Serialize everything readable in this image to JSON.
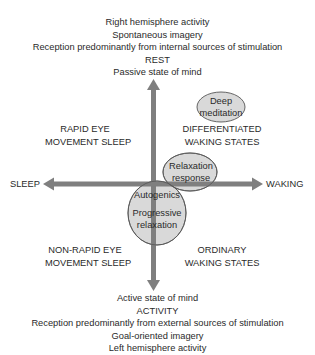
{
  "top_labels": [
    "Right hemisphere activity",
    "Spontaneous imagery",
    "Reception predominantly from internal sources of stimulation",
    "REST",
    "Passive state of mind"
  ],
  "bottom_labels": [
    "Active state of mind",
    "ACTIVITY",
    "Reception predominantly from external sources of stimulation",
    "Goal-oriented imagery",
    "Left hemisphere activity"
  ],
  "axes": {
    "left": "SLEEP",
    "right": "WAKING"
  },
  "quadrants": {
    "top_left": [
      "RAPID EYE",
      "MOVEMENT SLEEP"
    ],
    "top_right": [
      "DIFFERENTIATED",
      "WAKING STATES"
    ],
    "bottom_left": [
      "NON-RAPID EYE",
      "MOVEMENT SLEEP"
    ],
    "bottom_right": [
      "ORDINARY",
      "WAKING STATES"
    ]
  },
  "ellipses": {
    "deep_meditation": [
      "Deep",
      "meditation"
    ],
    "relaxation_response": [
      "Relaxation",
      "response"
    ],
    "autogenics": [
      "Autogenics",
      "Progressive",
      "relaxation"
    ]
  },
  "colors": {
    "axis": "#7f7f7f",
    "ellipse_fill": "#d9d9d9",
    "ellipse_stroke": "#555555",
    "text": "#2a2a2a"
  }
}
